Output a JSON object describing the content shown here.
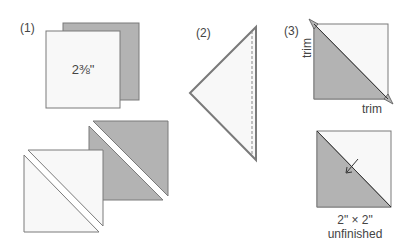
{
  "steps": [
    {
      "label": "(1)",
      "square_size": "2⅜\""
    },
    {
      "label": "(2)"
    },
    {
      "label": "(3)",
      "trim_left": "trim",
      "trim_bottom": "trim"
    }
  ],
  "result": {
    "size": "2\" × 2\"",
    "note": "unfinished"
  },
  "colors": {
    "light_fabric": "#f8f8f8",
    "dark_fabric": "#b3b3b3",
    "outline": "#7a7a7a",
    "text": "#444444"
  }
}
